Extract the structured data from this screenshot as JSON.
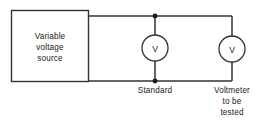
{
  "diagram": {
    "background_color": "#ffffff",
    "line_color": "#333333",
    "text_color": "#1a1a1a",
    "source_box": {
      "label_lines": [
        "Variable",
        "voltage",
        "source"
      ]
    },
    "standard_meter": {
      "symbol": "V",
      "label_lines": [
        "Standard"
      ]
    },
    "tested_meter": {
      "symbol": "V",
      "label_lines": [
        "Voltmeter",
        "to be",
        "tested"
      ]
    },
    "nodes": {
      "top_junction": "junction-dot",
      "bottom_junction": "junction-dot"
    }
  }
}
